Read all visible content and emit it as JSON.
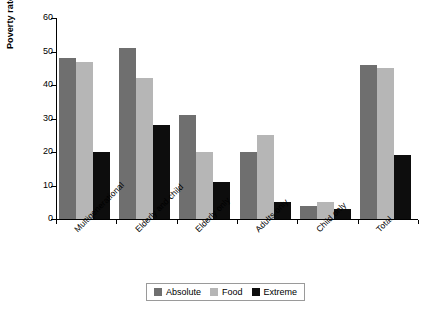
{
  "chart_data": {
    "type": "bar",
    "title": "",
    "xlabel": "",
    "ylabel": "Poverty rate (%)",
    "ylim": [
      0,
      60
    ],
    "yticks": [
      0,
      10,
      20,
      30,
      40,
      50,
      60
    ],
    "grid": false,
    "legend_position": "bottom",
    "categories": [
      "Multigenerational",
      "Elderly and child",
      "Elderly only",
      "Adults only",
      "Child only",
      "Total"
    ],
    "series": [
      {
        "name": "Absolute",
        "color": "#6f6f6f",
        "values": [
          48,
          51,
          31,
          20,
          4,
          46
        ]
      },
      {
        "name": "Food",
        "color": "#b6b6b6",
        "values": [
          47,
          42,
          20,
          25,
          5,
          45
        ]
      },
      {
        "name": "Extreme",
        "color": "#0d0d0d",
        "values": [
          20,
          28,
          11,
          5,
          3,
          19
        ]
      }
    ]
  }
}
